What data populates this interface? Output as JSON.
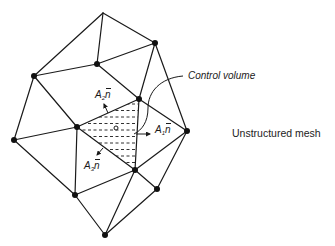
{
  "diagram": {
    "title": "Unstructured mesh",
    "callout_label": "Control volume",
    "normals": [
      {
        "area": "A",
        "index": "1",
        "vector": "n",
        "x": 155,
        "y": 125
      },
      {
        "area": "A",
        "index": "2",
        "vector": "n",
        "x": 89,
        "y": 90
      },
      {
        "area": "A",
        "index": "3",
        "vector": "n",
        "x": 83,
        "y": 160
      }
    ],
    "nodes": [
      {
        "id": 0,
        "x": 103,
        "y": 13,
        "dot": false
      },
      {
        "id": 1,
        "x": 155,
        "y": 43,
        "dot": true
      },
      {
        "id": 2,
        "x": 97,
        "y": 64,
        "dot": true
      },
      {
        "id": 3,
        "x": 34,
        "y": 76,
        "dot": true
      },
      {
        "id": 4,
        "x": 139,
        "y": 99,
        "dot": true
      },
      {
        "id": 5,
        "x": 77,
        "y": 127,
        "dot": true
      },
      {
        "id": 6,
        "x": 14,
        "y": 140,
        "dot": true
      },
      {
        "id": 7,
        "x": 187,
        "y": 131,
        "dot": true
      },
      {
        "id": 8,
        "x": 135,
        "y": 170,
        "dot": true
      },
      {
        "id": 9,
        "x": 157,
        "y": 189,
        "dot": true
      },
      {
        "id": 10,
        "x": 75,
        "y": 195,
        "dot": true
      },
      {
        "id": 11,
        "x": 105,
        "y": 235,
        "dot": true
      }
    ],
    "edges": [
      [
        0,
        1
      ],
      [
        0,
        2
      ],
      [
        0,
        3
      ],
      [
        1,
        2
      ],
      [
        1,
        4
      ],
      [
        1,
        7
      ],
      [
        2,
        3
      ],
      [
        2,
        4
      ],
      [
        3,
        5
      ],
      [
        3,
        6
      ],
      [
        4,
        5
      ],
      [
        4,
        7
      ],
      [
        4,
        8
      ],
      [
        5,
        6
      ],
      [
        5,
        8
      ],
      [
        5,
        10
      ],
      [
        6,
        10
      ],
      [
        7,
        8
      ],
      [
        7,
        9
      ],
      [
        8,
        9
      ],
      [
        8,
        10
      ],
      [
        8,
        11
      ],
      [
        9,
        11
      ],
      [
        10,
        11
      ]
    ],
    "control_volume": {
      "vertices": [
        5,
        4,
        8
      ],
      "centroid": {
        "x": 116,
        "y": 128
      },
      "fill": "dashed-horizontal"
    },
    "colors": {
      "line": "#1a1a1a",
      "background": "#ffffff"
    }
  }
}
